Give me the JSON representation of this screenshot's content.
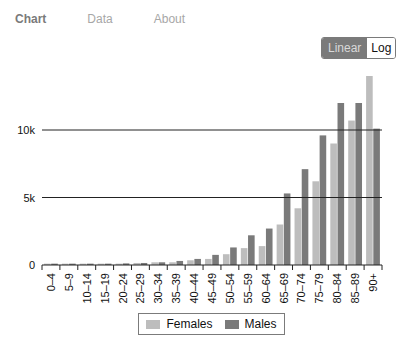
{
  "nav": {
    "tabs": [
      {
        "label": "Chart",
        "active": true
      },
      {
        "label": "Data",
        "active": false
      },
      {
        "label": "About",
        "active": false
      }
    ]
  },
  "scale_toggle": {
    "options": [
      "Linear",
      "Log"
    ],
    "selected": "Linear"
  },
  "colors": {
    "females": "#bdbdbd",
    "males": "#7a7a7a",
    "grid": "#111111"
  },
  "chart_data": {
    "type": "bar",
    "title": "",
    "xlabel": "",
    "ylabel": "",
    "categories": [
      "0–4",
      "5–9",
      "10–14",
      "15–19",
      "20–24",
      "25–29",
      "30–34",
      "35–39",
      "40–44",
      "45–49",
      "50–54",
      "55–59",
      "60–64",
      "65–69",
      "70–74",
      "75–79",
      "80–84",
      "85–89",
      "90+"
    ],
    "series": [
      {
        "name": "Females",
        "values": [
          100,
          100,
          100,
          100,
          100,
          150,
          200,
          200,
          350,
          450,
          800,
          1250,
          1400,
          3000,
          4200,
          6200,
          9000,
          10700,
          14000
        ]
      },
      {
        "name": "Males",
        "values": [
          100,
          100,
          100,
          100,
          120,
          150,
          200,
          300,
          450,
          750,
          1300,
          2200,
          2700,
          5300,
          7100,
          9600,
          12000,
          12000,
          10100
        ]
      }
    ],
    "y_ticks": [
      "0",
      "5k",
      "10k"
    ],
    "y_tick_values": [
      0,
      5000,
      10000
    ],
    "ylim": [
      0,
      14300
    ],
    "grid": true,
    "legend_position": "bottom"
  },
  "legend": {
    "items": [
      {
        "label": "Females"
      },
      {
        "label": "Males"
      }
    ]
  }
}
